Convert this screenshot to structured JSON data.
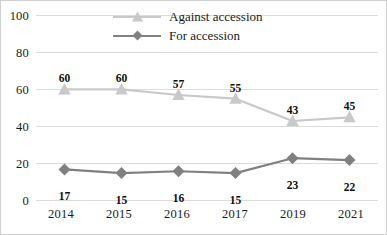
{
  "chart_data": {
    "type": "line",
    "title": "",
    "subtitle": "",
    "xlabel": "",
    "ylabel": "",
    "categories": [
      "2014",
      "2015",
      "2016",
      "2017",
      "2019",
      "2021"
    ],
    "ylim": [
      0,
      100
    ],
    "yticks": [
      "0",
      "20",
      "40",
      "60",
      "80",
      "100"
    ],
    "grid": true,
    "legend_position": "top-center",
    "series": [
      {
        "name": "Against accession",
        "values": [
          60,
          60,
          57,
          55,
          43,
          45
        ],
        "color": "#c9c9c9",
        "marker": "triangle",
        "label_position": "above"
      },
      {
        "name": "For accession",
        "values": [
          17,
          15,
          16,
          15,
          23,
          22
        ],
        "color": "#808080",
        "marker": "diamond",
        "label_position": "below"
      }
    ]
  },
  "legend": {
    "items": [
      {
        "label": "Against accession"
      },
      {
        "label": "For accession"
      }
    ]
  },
  "axes": {
    "y": {
      "ticks": [
        "100",
        "80",
        "60",
        "40",
        "20",
        "0"
      ]
    },
    "x": {
      "ticks": [
        "2014",
        "2015",
        "2016",
        "2017",
        "2019",
        "2021"
      ]
    }
  },
  "colors": {
    "against": "#c9c9c9",
    "for": "#808080",
    "grid": "#dcdcdc",
    "text": "#1a1a1a",
    "border": "#d0d0d0"
  }
}
